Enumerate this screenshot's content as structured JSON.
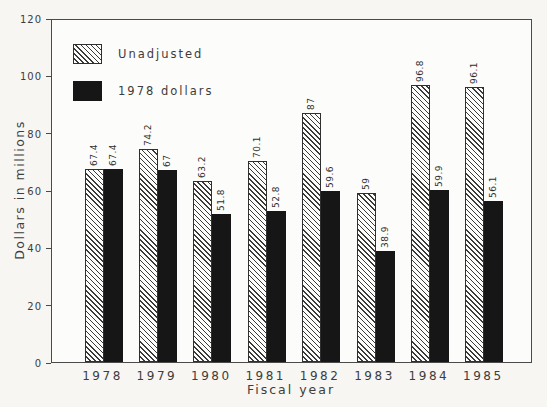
{
  "chart_data": {
    "type": "bar",
    "title": "",
    "xlabel": "Fiscal year",
    "ylabel": "Dollars in millions",
    "categories": [
      "1978",
      "1979",
      "1980",
      "1981",
      "1982",
      "1983",
      "1984",
      "1985"
    ],
    "series": [
      {
        "name": "Unadjusted",
        "style": "hatched",
        "values": [
          67.4,
          74.2,
          63.2,
          70.1,
          87,
          59,
          96.8,
          96.1
        ]
      },
      {
        "name": "1978 dollars",
        "style": "solid",
        "values": [
          67.4,
          67,
          51.8,
          52.8,
          59.6,
          38.9,
          59.9,
          56.1
        ]
      }
    ],
    "ylim": [
      0,
      120
    ],
    "yticks": [
      0,
      20,
      40,
      60,
      80,
      100,
      120
    ],
    "grid": false,
    "legend_position": "top-left-inside",
    "bar_value_labels_rotated": true
  },
  "colors": {
    "page_bg": "#f7f6f3",
    "plot_bg": "#fcfcfa",
    "axis": "#4a4a4a",
    "text": "#3d3d3d",
    "solid_bar": "#161616",
    "hatch_line": "#3a3a3a"
  }
}
